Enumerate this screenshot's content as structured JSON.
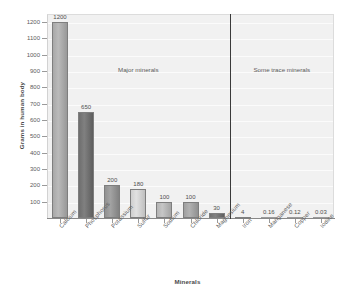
{
  "chart_data": {
    "type": "bar",
    "title": "",
    "xlabel": "Minerals",
    "ylabel": "Grams in human body",
    "ylim": [
      0,
      1250
    ],
    "grid": true,
    "legend_position": "none",
    "categories": [
      "Calcium",
      "Phosphorus",
      "Potassium",
      "Sulfur",
      "Sodium",
      "Chloride",
      "Magnesium",
      "Iron",
      "Manganese",
      "Copper",
      "Iodine"
    ],
    "values": [
      1200,
      650,
      200,
      180,
      100,
      100,
      30,
      4,
      0.16,
      0.12,
      0.03
    ],
    "value_labels": [
      "1200",
      "650",
      "200",
      "180",
      "100",
      "100",
      "30",
      "4",
      "0.16",
      "0.12",
      "0.03"
    ],
    "bar_colors": [
      "#a8a8a8",
      "#6e6e6e",
      "#919191",
      "#cfcfcf",
      "#b4b4b4",
      "#a0a0a0",
      "#6f6f6f",
      "#8e8e8e",
      "#bdbdbd",
      "#bdbdbd",
      "#bdbdbd"
    ],
    "y_ticks": [
      1200,
      1100,
      1000,
      900,
      800,
      700,
      600,
      500,
      400,
      300,
      200,
      100
    ],
    "y_tick_labels": [
      "1200",
      "1100",
      "1000",
      "900",
      "800",
      "700",
      "600",
      "500",
      "400",
      "300",
      "200",
      "100"
    ],
    "annotations": [
      {
        "text": "Major minerals",
        "group": "major"
      },
      {
        "text": "Some trace minerals",
        "group": "trace"
      }
    ],
    "divider_after_category": "Magnesium"
  },
  "axes": {
    "y_title": "Grams in human body",
    "x_title": "Minerals"
  },
  "sections": {
    "major_label": "Major minerals",
    "trace_label": "Some trace minerals"
  },
  "colors": {
    "plot_background": "#f1f1f1",
    "gridline": "#fbfbfb",
    "divider": "#3a3a3a",
    "text": "#555555"
  }
}
